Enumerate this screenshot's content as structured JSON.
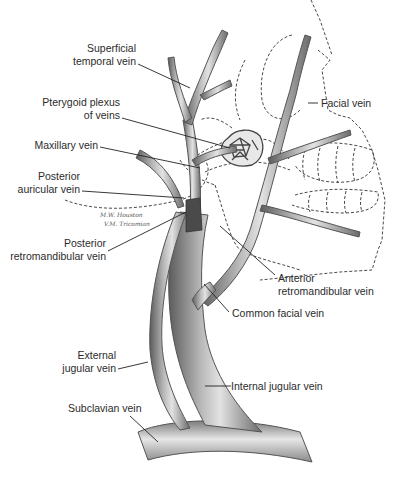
{
  "figure": {
    "signature": [
      "M.W. Houston",
      "V.M. Tricomian"
    ]
  },
  "labels": [
    {
      "id": "superficial-temporal-vein",
      "lines": [
        "Superficial",
        "temporal vein"
      ]
    },
    {
      "id": "pterygoid-plexus",
      "lines": [
        "Pterygoid plexus",
        "of veins"
      ]
    },
    {
      "id": "maxillary-vein",
      "lines": [
        "Maxillary vein"
      ]
    },
    {
      "id": "posterior-auricular-vein",
      "lines": [
        "Posterior",
        "auricular vein"
      ]
    },
    {
      "id": "posterior-retromandibular-vein",
      "lines": [
        "Posterior",
        "retromandibular vein"
      ]
    },
    {
      "id": "external-jugular-vein",
      "lines": [
        "External",
        "jugular vein"
      ]
    },
    {
      "id": "subclavian-vein",
      "lines": [
        "Subclavian vein"
      ]
    },
    {
      "id": "facial-vein",
      "lines": [
        "Facial vein"
      ]
    },
    {
      "id": "anterior-retromandibular-vein",
      "lines": [
        "Anterior",
        "retromandibular vein"
      ]
    },
    {
      "id": "common-facial-vein",
      "lines": [
        "Common facial vein"
      ]
    },
    {
      "id": "internal-jugular-vein",
      "lines": [
        "Internal jugular vein"
      ]
    }
  ],
  "colors": {
    "vein_fill": "#9a9a9a",
    "vein_dark": "#5a5a5a",
    "vein_light": "#d8d8d8",
    "leader_line": "#222222",
    "outline_dashed": "#333333",
    "text": "#2b2b2b"
  }
}
